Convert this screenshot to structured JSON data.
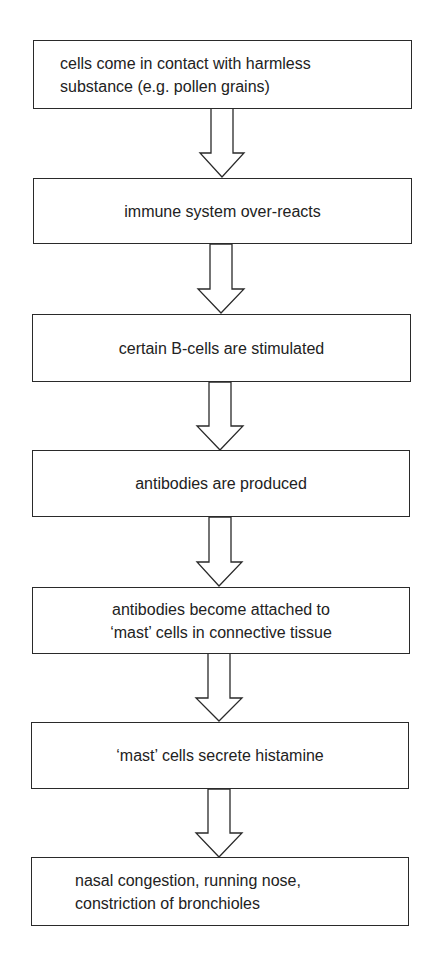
{
  "diagram": {
    "type": "flowchart",
    "direction": "top-to-bottom",
    "colors": {
      "stroke": "#2a2a2a",
      "text": "#222222",
      "background": "#ffffff"
    },
    "steps": [
      {
        "id": "step-1",
        "text": "cells come in contact with harmless\nsubstance (e.g. pollen grains)",
        "align": "left"
      },
      {
        "id": "step-2",
        "text": "immune system over-reacts",
        "align": "center"
      },
      {
        "id": "step-3",
        "text": "certain B-cells are stimulated",
        "align": "center"
      },
      {
        "id": "step-4",
        "text": "antibodies are produced",
        "align": "center"
      },
      {
        "id": "step-5",
        "text": "antibodies become attached to\n‘mast’ cells in connective tissue",
        "align": "center"
      },
      {
        "id": "step-6",
        "text": "‘mast’ cells secrete histamine",
        "align": "center"
      },
      {
        "id": "step-7",
        "text": "nasal congestion, running nose,\nconstriction of bronchioles",
        "align": "left"
      }
    ],
    "arrows": [
      {
        "from": "step-1",
        "to": "step-2",
        "icon": "down-arrow-icon"
      },
      {
        "from": "step-2",
        "to": "step-3",
        "icon": "down-arrow-icon"
      },
      {
        "from": "step-3",
        "to": "step-4",
        "icon": "down-arrow-icon"
      },
      {
        "from": "step-4",
        "to": "step-5",
        "icon": "down-arrow-icon"
      },
      {
        "from": "step-5",
        "to": "step-6",
        "icon": "down-arrow-icon"
      },
      {
        "from": "step-6",
        "to": "step-7",
        "icon": "down-arrow-icon"
      }
    ]
  }
}
